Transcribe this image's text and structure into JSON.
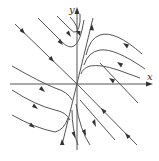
{
  "diagram": {
    "type": "phase-portrait",
    "axes": {
      "x_label": "x",
      "y_label": "y",
      "origin_px": [
        77,
        84
      ]
    },
    "colors": {
      "line": "#555555",
      "arrow": "#333333",
      "background": "#ffffff"
    }
  }
}
